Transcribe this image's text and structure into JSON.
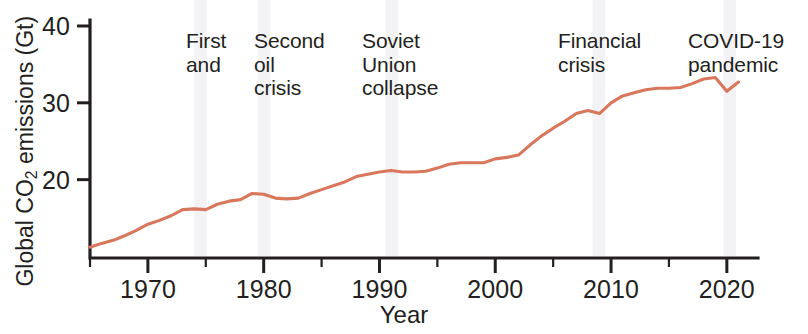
{
  "figure": {
    "background_color": "#ffffff",
    "line_color": "#d9775c",
    "axis_color": "#231f20",
    "band_color": "#e9eaec"
  },
  "axes": {
    "ylabel_text": "Global CO",
    "ylabel_sub": "2",
    "ylabel_tail": " emissions (Gt)",
    "xlabel": "Year",
    "ytick_labels": [
      "40",
      "30",
      "20"
    ],
    "xtick_labels": [
      "1970",
      "1980",
      "1990",
      "2000",
      "2010",
      "2020"
    ]
  },
  "annotations": [
    {
      "id": "first-and",
      "text": "First\nand"
    },
    {
      "id": "second-oil-crisis",
      "text": "Second\noil\ncrisis"
    },
    {
      "id": "soviet-union-collapse",
      "text": "Soviet\nUnion\ncollapse"
    },
    {
      "id": "financial-crisis",
      "text": "Financial\ncrisis"
    },
    {
      "id": "covid-19-pandemic",
      "text": "COVID-19\npandemic"
    }
  ],
  "chart_data": {
    "type": "line",
    "title": "",
    "xlabel": "Year",
    "ylabel": "Global CO2 emissions (Gt)",
    "xlim": [
      1965,
      2022
    ],
    "ylim": [
      9.8,
      40
    ],
    "grid": false,
    "legend": false,
    "y_ticks": [
      20,
      30,
      40
    ],
    "y_minor_ticks": [],
    "x_ticks": [
      1970,
      1980,
      1990,
      2000,
      2010,
      2020
    ],
    "x_minor_ticks": [
      1965,
      1975,
      1985,
      1995,
      2005,
      2015
    ],
    "series": [
      {
        "name": "Global CO2 emissions",
        "color": "#d9775c",
        "x": [
          1965,
          1966,
          1967,
          1968,
          1969,
          1970,
          1971,
          1972,
          1973,
          1974,
          1975,
          1976,
          1977,
          1978,
          1979,
          1980,
          1981,
          1982,
          1983,
          1984,
          1985,
          1986,
          1987,
          1988,
          1989,
          1990,
          1991,
          1992,
          1993,
          1994,
          1995,
          1996,
          1997,
          1998,
          1999,
          2000,
          2001,
          2002,
          2003,
          2004,
          2005,
          2006,
          2007,
          2008,
          2009,
          2010,
          2011,
          2012,
          2013,
          2014,
          2015,
          2016,
          2017,
          2018,
          2019,
          2020,
          2021
        ],
        "y": [
          11.2,
          11.7,
          12.1,
          12.7,
          13.4,
          14.2,
          14.7,
          15.3,
          16.1,
          16.2,
          16.1,
          16.8,
          17.2,
          17.4,
          18.2,
          18.1,
          17.6,
          17.5,
          17.6,
          18.2,
          18.7,
          19.2,
          19.7,
          20.4,
          20.7,
          21.0,
          21.2,
          21.0,
          21.0,
          21.1,
          21.5,
          22.0,
          22.2,
          22.2,
          22.2,
          22.7,
          22.9,
          23.2,
          24.5,
          25.7,
          26.7,
          27.6,
          28.6,
          29.0,
          28.6,
          30.0,
          30.9,
          31.3,
          31.7,
          31.9,
          31.9,
          32.0,
          32.5,
          33.1,
          33.3,
          31.5,
          32.7
        ]
      }
    ],
    "event_bands": [
      {
        "label": "First and",
        "x_start": 1974.0,
        "x_end": 1975.1
      },
      {
        "label": "Second oil crisis",
        "x_start": 1979.5,
        "x_end": 1980.6
      },
      {
        "label": "Soviet Union collapse",
        "x_start": 1990.5,
        "x_end": 1991.6
      },
      {
        "label": "Financial crisis",
        "x_start": 2008.4,
        "x_end": 2009.5
      },
      {
        "label": "COVID-19 pandemic",
        "x_start": 2019.7,
        "x_end": 2020.8
      }
    ]
  }
}
